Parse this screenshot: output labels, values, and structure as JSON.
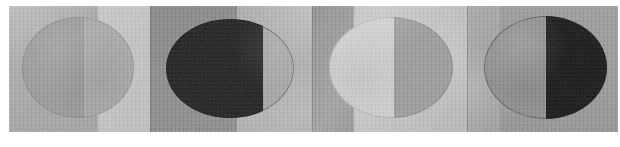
{
  "figure": {
    "kind": "photographic-contact-strip",
    "description": "A horizontal strip of four abutting photographic frames, each showing a large circular disc split vertically into a lighter and a darker half, in the manner of a moon-phase sequence. Rendered in grayscale with a fine vertical scanner-ribbing texture and soft diagonal haze.",
    "panel_count": 4,
    "orientation": "horizontal",
    "background_color": "#ffffff",
    "strip": {
      "left": 9,
      "top": 6,
      "width": 609,
      "height": 126
    },
    "texture": {
      "vertical_scanlines": "true",
      "horizontal_banding": "true",
      "grain": "subtle"
    }
  },
  "panels": [
    {
      "index": "1",
      "name": "panel-1",
      "width": 141,
      "background_color": "#b9b9b9",
      "left_band": {
        "color": "#a8a8a8",
        "left_pct": 0,
        "width_pct": 63
      },
      "right_band": {
        "color": "#c8c8c8",
        "left_pct": 63,
        "width_pct": 37
      },
      "disc": {
        "left_pct": 9,
        "top_pct": 9,
        "size_pct": 80,
        "left_half_color": "#9b9b9b",
        "right_half_color": "#ababab",
        "split_pct": 55,
        "outline": "faint",
        "phase_label": "near-full, faint terminator"
      },
      "haze": "diagonal light haze upper-left to lower-right"
    },
    {
      "index": "2",
      "name": "panel-2",
      "width": 162,
      "background_color": "#a4a4a4",
      "left_band": {
        "color": "#8d8d8d",
        "left_pct": 0,
        "width_pct": 54
      },
      "right_band": {
        "color": "#b0b0b0",
        "left_pct": 54,
        "width_pct": 46
      },
      "disc": {
        "left_pct": 10,
        "top_pct": 10,
        "size_pct": 79,
        "left_half_color": "#1d1d1d",
        "right_half_color": "#a6a6a6",
        "split_pct": 76,
        "outline": "hard dark edge",
        "phase_label": "waning gibbous shadow, dark left majority"
      },
      "haze": "soft bright bloom upper-right corner"
    },
    {
      "index": "3",
      "name": "panel-3",
      "width": 155,
      "background_color": "#a9a9a9",
      "left_band": {
        "color": "#8a8a8a",
        "left_pct": 0,
        "width_pct": 27
      },
      "right_band": {
        "color": "#c1c1c1",
        "left_pct": 27,
        "width_pct": 73
      },
      "disc": {
        "left_pct": 11,
        "top_pct": 9,
        "size_pct": 80,
        "left_half_color": "#d2d2d2",
        "right_half_color": "#9d9d9d",
        "split_pct": 52,
        "outline": "faint",
        "phase_label": "half lit on the left"
      },
      "haze": "broad diagonal light sweep through centre"
    },
    {
      "index": "4",
      "name": "panel-4",
      "width": 151,
      "background_color": "#9e9e9e",
      "left_band": {
        "color": "#a5a5a5",
        "left_pct": 0,
        "width_pct": 22
      },
      "right_band": {
        "color": "#999999",
        "left_pct": 22,
        "width_pct": 78
      },
      "disc": {
        "left_pct": 11,
        "top_pct": 8,
        "size_pct": 82,
        "left_half_color": "#8f8f8f",
        "right_half_color": "#131313",
        "split_pct": 50,
        "outline": "thin dark rim on left",
        "phase_label": "half shadowed on the right"
      },
      "haze": "pale vertical wash at the far left edge"
    }
  ],
  "palette": {
    "paper_white": "#ffffff",
    "lightest_gray": "#d2d2d2",
    "light_gray": "#c8c8c8",
    "mid_gray": "#a8a8a8",
    "dark_gray": "#8a8a8a",
    "near_black": "#131313"
  }
}
